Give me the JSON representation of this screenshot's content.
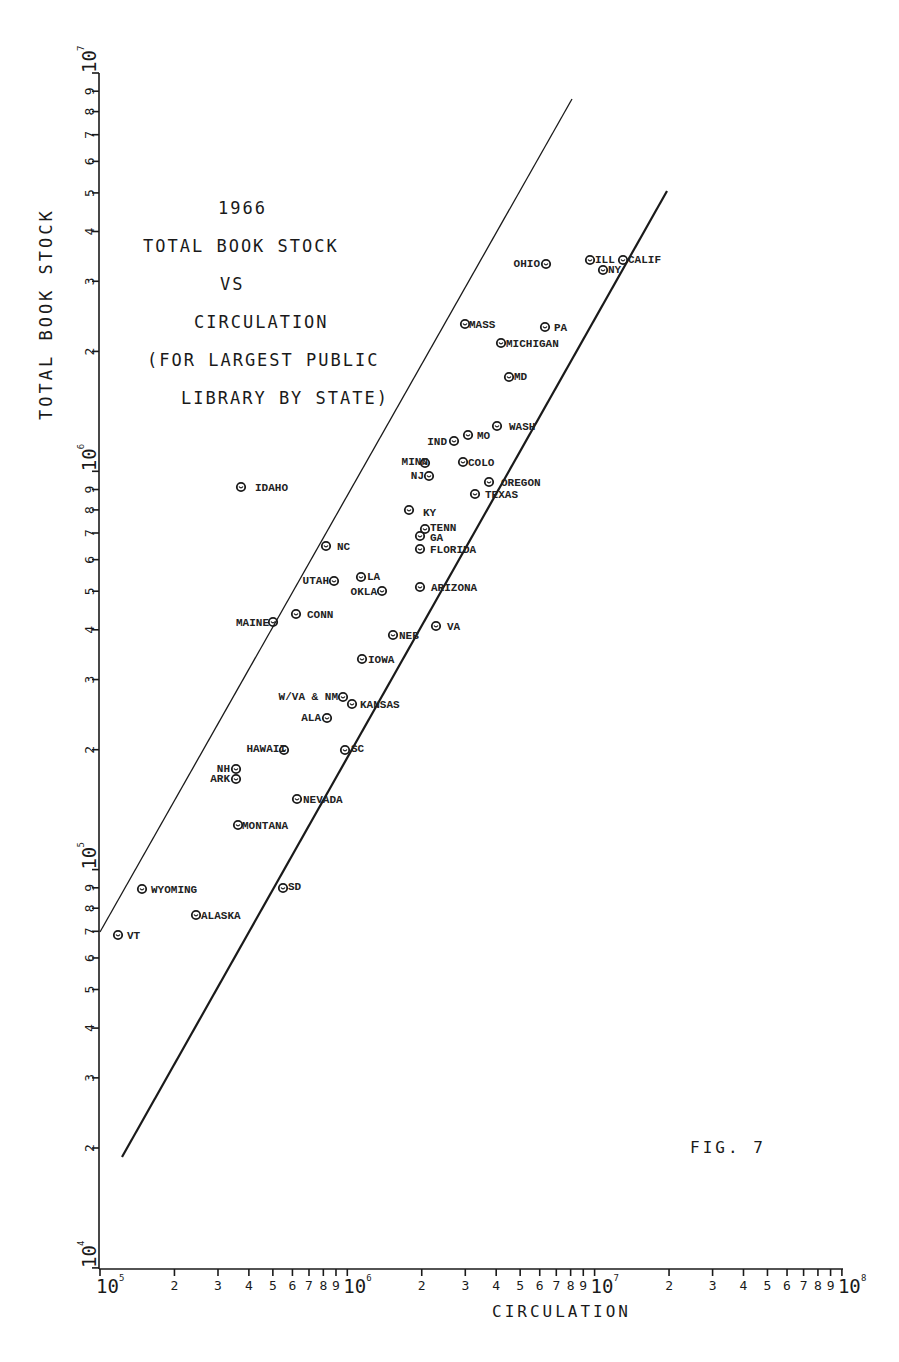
{
  "title": {
    "lines": [
      "1966",
      "TOTAL BOOK STOCK",
      "VS",
      "CIRCULATION",
      "(FOR LARGEST PUBLIC",
      "LIBRARY BY STATE)"
    ]
  },
  "axes": {
    "xlabel": "CIRCULATION",
    "ylabel": "TOTAL BOOK STOCK"
  },
  "figure_label": "FIG. 7",
  "colors": {
    "ink": "#1a1a1a",
    "background": "#ffffff"
  },
  "chart_data": {
    "type": "scatter",
    "xlabel": "CIRCULATION",
    "ylabel": "TOTAL BOOK STOCK",
    "xscale": "log",
    "yscale": "log",
    "xlim": [
      100000,
      100000000
    ],
    "ylim": [
      10000,
      10000000
    ],
    "x_ticks": [
      "10^5",
      "2",
      "3",
      "4",
      "5",
      "6",
      "7",
      "8",
      "9",
      "10^6",
      "2",
      "3",
      "4",
      "5",
      "6",
      "7",
      "8",
      "9",
      "10^7",
      "2",
      "3",
      "4",
      "5",
      "6",
      "7",
      "8",
      "9",
      "10^8"
    ],
    "y_ticks": [
      "10^4",
      "2",
      "3",
      "4",
      "5",
      "6",
      "7",
      "8",
      "9",
      "10^5",
      "2",
      "3",
      "4",
      "5",
      "6",
      "7",
      "8",
      "9",
      "10^6",
      "2",
      "3",
      "4",
      "5",
      "6",
      "7",
      "8",
      "9",
      "10^7"
    ],
    "grid": false,
    "annotation": "FIG. 7",
    "reference_lines": [
      {
        "name": "upper bound",
        "style": "solid-thin",
        "from": [
          100000,
          70000
        ],
        "to": [
          7800000,
          8500000
        ]
      },
      {
        "name": "lower bound",
        "style": "solid-thick",
        "from": [
          120000,
          19000
        ],
        "to": [
          19000000,
          5100000
        ]
      }
    ],
    "points": [
      {
        "label": "CALIF",
        "x": 13000000,
        "y": 3400000
      },
      {
        "label": "ILL",
        "x": 9600000,
        "y": 3400000
      },
      {
        "label": "NY",
        "x": 10800000,
        "y": 3200000
      },
      {
        "label": "OHIO",
        "x": 6400000,
        "y": 3300000
      },
      {
        "label": "MASS",
        "x": 3000000,
        "y": 2350000
      },
      {
        "label": "PA",
        "x": 6300000,
        "y": 2300000
      },
      {
        "label": "MICHIGAN",
        "x": 4200000,
        "y": 2100000
      },
      {
        "label": "MD",
        "x": 4500000,
        "y": 1700000
      },
      {
        "label": "WASH",
        "x": 4000000,
        "y": 1300000
      },
      {
        "label": "MO",
        "x": 3100000,
        "y": 1230000
      },
      {
        "label": "IND",
        "x": 2700000,
        "y": 1190000
      },
      {
        "label": "MINN",
        "x": 2050000,
        "y": 1050000
      },
      {
        "label": "COLO",
        "x": 2900000,
        "y": 1050000
      },
      {
        "label": "NJ",
        "x": 2150000,
        "y": 970000
      },
      {
        "label": "OREGON",
        "x": 3700000,
        "y": 940000
      },
      {
        "label": "TEXAS",
        "x": 3300000,
        "y": 880000
      },
      {
        "label": "IDAHO",
        "x": 370000,
        "y": 910000
      },
      {
        "label": "KY",
        "x": 1800000,
        "y": 800000
      },
      {
        "label": "TENN",
        "x": 2050000,
        "y": 720000
      },
      {
        "label": "GA",
        "x": 1950000,
        "y": 690000
      },
      {
        "label": "FLORIDA",
        "x": 1950000,
        "y": 640000
      },
      {
        "label": "NC",
        "x": 820000,
        "y": 650000
      },
      {
        "label": "UTAH",
        "x": 880000,
        "y": 530000
      },
      {
        "label": "LA",
        "x": 1130000,
        "y": 540000
      },
      {
        "label": "OKLA",
        "x": 1380000,
        "y": 500000
      },
      {
        "label": "ARIZONA",
        "x": 1950000,
        "y": 510000
      },
      {
        "label": "CONN",
        "x": 620000,
        "y": 440000
      },
      {
        "label": "MAINE",
        "x": 500000,
        "y": 420000
      },
      {
        "label": "VA",
        "x": 2300000,
        "y": 410000
      },
      {
        "label": "NEB",
        "x": 1530000,
        "y": 390000
      },
      {
        "label": "IOWA",
        "x": 1140000,
        "y": 340000
      },
      {
        "label": "W/VA",
        "x": 960000,
        "y": 270000
      },
      {
        "label": "NM",
        "x": 1040000,
        "y": 260000
      },
      {
        "label": "KANSAS",
        "x": 1040000,
        "y": 260000
      },
      {
        "label": "ALA",
        "x": 830000,
        "y": 240000
      },
      {
        "label": "HAWAII",
        "x": 550000,
        "y": 200000
      },
      {
        "label": "SC",
        "x": 980000,
        "y": 200000
      },
      {
        "label": "NH",
        "x": 360000,
        "y": 180000
      },
      {
        "label": "ARK",
        "x": 360000,
        "y": 170000
      },
      {
        "label": "NEVADA",
        "x": 620000,
        "y": 150000
      },
      {
        "label": "MONTANA",
        "x": 360000,
        "y": 130000
      },
      {
        "label": "SD",
        "x": 550000,
        "y": 90000
      },
      {
        "label": "WYOMING",
        "x": 148000,
        "y": 90000
      },
      {
        "label": "ALASKA",
        "x": 245000,
        "y": 77000
      },
      {
        "label": "VT",
        "x": 118000,
        "y": 69000
      }
    ]
  },
  "point_labels_display": [
    {
      "text": "CALIF",
      "px": 623,
      "py": 260,
      "anchor": "start",
      "dx": 5,
      "dy": 3
    },
    {
      "text": "ILL",
      "px": 590,
      "py": 260,
      "anchor": "start",
      "dx": 5,
      "dy": 3
    },
    {
      "text": "NY",
      "px": 603,
      "py": 270,
      "anchor": "start",
      "dx": 5,
      "dy": 3
    },
    {
      "text": "OHIO",
      "px": 546,
      "py": 264,
      "anchor": "end",
      "dx": -6,
      "dy": 3
    },
    {
      "text": "MASS",
      "px": 465,
      "py": 324,
      "anchor": "start",
      "dx": 4,
      "dy": 4
    },
    {
      "text": "PA",
      "px": 545,
      "py": 327,
      "anchor": "start",
      "dx": 9,
      "dy": 4
    },
    {
      "text": "MICHIGAN",
      "px": 501,
      "py": 343,
      "anchor": "start",
      "dx": 5,
      "dy": 4
    },
    {
      "text": "MD",
      "px": 509,
      "py": 377,
      "anchor": "start",
      "dx": 5,
      "dy": 3
    },
    {
      "text": "WASH",
      "px": 497,
      "py": 426,
      "anchor": "start",
      "dx": 12,
      "dy": 4
    },
    {
      "text": "MO",
      "px": 468,
      "py": 435,
      "anchor": "start",
      "dx": 9,
      "dy": 4
    },
    {
      "text": "IND",
      "px": 454,
      "py": 441,
      "anchor": "end",
      "dx": -7,
      "dy": 4
    },
    {
      "text": "MINN",
      "px": 425,
      "py": 463,
      "anchor": "end",
      "dx": 3,
      "dy": 2
    },
    {
      "text": "COLO",
      "px": 463,
      "py": 462,
      "anchor": "start",
      "dx": 5,
      "dy": 4
    },
    {
      "text": "NJ",
      "px": 429,
      "py": 476,
      "anchor": "end",
      "dx": -5,
      "dy": 3
    },
    {
      "text": "OREGON",
      "px": 489,
      "py": 482,
      "anchor": "start",
      "dx": 12,
      "dy": 4
    },
    {
      "text": "TEXAS",
      "px": 475,
      "py": 494,
      "anchor": "start",
      "dx": 10,
      "dy": 4
    },
    {
      "text": "IDAHO",
      "px": 241,
      "py": 487,
      "anchor": "start",
      "dx": 14,
      "dy": 4
    },
    {
      "text": "KY",
      "px": 409,
      "py": 510,
      "anchor": "start",
      "dx": 14,
      "dy": 6
    },
    {
      "text": "TENN",
      "px": 425,
      "py": 529,
      "anchor": "start",
      "dx": 5,
      "dy": 2
    },
    {
      "text": "GA",
      "px": 420,
      "py": 536,
      "anchor": "start",
      "dx": 10,
      "dy": 5
    },
    {
      "text": "FLORIDA",
      "px": 420,
      "py": 549,
      "anchor": "start",
      "dx": 10,
      "dy": 4
    },
    {
      "text": "NC",
      "px": 326,
      "py": 546,
      "anchor": "start",
      "dx": 11,
      "dy": 4
    },
    {
      "text": "UTAH",
      "px": 334,
      "py": 581,
      "anchor": "end",
      "dx": -5,
      "dy": 3
    },
    {
      "text": "LA",
      "px": 361,
      "py": 577,
      "anchor": "start",
      "dx": 6,
      "dy": 3
    },
    {
      "text": "OKLA",
      "px": 382,
      "py": 591,
      "anchor": "end",
      "dx": -5,
      "dy": 4
    },
    {
      "text": "ARIZONA",
      "px": 420,
      "py": 587,
      "anchor": "start",
      "dx": 11,
      "dy": 4
    },
    {
      "text": "CONN",
      "px": 296,
      "py": 614,
      "anchor": "start",
      "dx": 11,
      "dy": 4
    },
    {
      "text": "MAINE",
      "px": 273,
      "py": 622,
      "anchor": "end",
      "dx": -4,
      "dy": 4
    },
    {
      "text": "VA",
      "px": 436,
      "py": 626,
      "anchor": "start",
      "dx": 11,
      "dy": 4
    },
    {
      "text": "NEB",
      "px": 393,
      "py": 635,
      "anchor": "start",
      "dx": 6,
      "dy": 4
    },
    {
      "text": "IOWA",
      "px": 362,
      "py": 659,
      "anchor": "start",
      "dx": 6,
      "dy": 4
    },
    {
      "text": "W/VA & NM",
      "px": 343,
      "py": 697,
      "anchor": "end",
      "dx": -5,
      "dy": 3
    },
    {
      "text": "KANSAS",
      "px": 352,
      "py": 704,
      "anchor": "start",
      "dx": 8,
      "dy": 4
    },
    {
      "text": "ALA",
      "px": 327,
      "py": 718,
      "anchor": "end",
      "dx": -6,
      "dy": 3
    },
    {
      "text": "HAWAII",
      "px": 284,
      "py": 750,
      "anchor": "end",
      "dx": 2,
      "dy": 2
    },
    {
      "text": "SC",
      "px": 345,
      "py": 750,
      "anchor": "start",
      "dx": 6,
      "dy": 2
    },
    {
      "text": "NH",
      "px": 236,
      "py": 769,
      "anchor": "end",
      "dx": -6,
      "dy": 3
    },
    {
      "text": "ARK",
      "px": 236,
      "py": 779,
      "anchor": "end",
      "dx": -6,
      "dy": 3
    },
    {
      "text": "NEVADA",
      "px": 297,
      "py": 799,
      "anchor": "start",
      "dx": 6,
      "dy": 4
    },
    {
      "text": "MONTANA",
      "px": 238,
      "py": 825,
      "anchor": "start",
      "dx": 4,
      "dy": 4
    },
    {
      "text": "SD",
      "px": 283,
      "py": 888,
      "anchor": "start",
      "dx": 5,
      "dy": 2
    },
    {
      "text": "WYOMING",
      "px": 142,
      "py": 889,
      "anchor": "start",
      "dx": 9,
      "dy": 4
    },
    {
      "text": "ALASKA",
      "px": 196,
      "py": 915,
      "anchor": "start",
      "dx": 5,
      "dy": 4
    },
    {
      "text": "VT",
      "px": 118,
      "py": 935,
      "anchor": "start",
      "dx": 9,
      "dy": 4
    }
  ]
}
